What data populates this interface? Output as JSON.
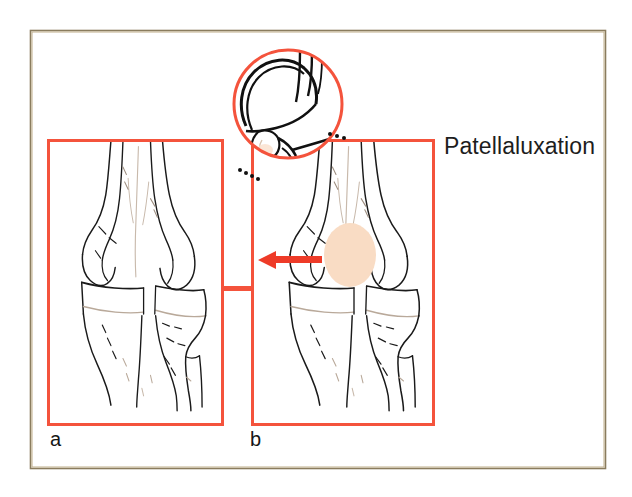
{
  "figure": {
    "kind": "medical-illustration",
    "title": "Patellaluxation",
    "outer_frame": {
      "name": "outer-border-frame",
      "color": "#7c6f52",
      "x": 30,
      "y": 30,
      "width": 575,
      "height": 438
    },
    "accent_color": "#f4533c",
    "arrow_color": "#ee3b28",
    "patella_fill": "#f9dcc4",
    "bone_line_color": "#1a1a1a",
    "bone_shade_color": "#b9a99a"
  },
  "panels": [
    {
      "id": "a",
      "name": "panel-a",
      "label": "a",
      "label_x": 50,
      "label_y": 428,
      "description": "Normal knee, anterior view",
      "box": {
        "x": 48,
        "y": 140,
        "width": 174,
        "height": 284
      },
      "has_arrow": false,
      "has_patella_marker": false
    },
    {
      "id": "b",
      "name": "panel-b",
      "label": "b",
      "label_x": 250,
      "label_y": 428,
      "description": "Luxated patella, anterior view with displacement arrow",
      "box": {
        "x": 252,
        "y": 140,
        "width": 181,
        "height": 284
      },
      "has_arrow": true,
      "has_patella_marker": true
    }
  ],
  "connector": {
    "name": "panel-connector-bar",
    "x": 222,
    "y": 286,
    "width": 30,
    "height": 5
  },
  "inset": {
    "name": "magnifier-circle-inset",
    "description": "Lateral magnified view of patella and femoral trochlea",
    "center_x": 288,
    "center_y": 104,
    "radius": 56
  },
  "annotations": {
    "displacement_arrow": {
      "name": "displacement-arrow",
      "direction": "left",
      "tail_x": 322,
      "head_x": 258,
      "y": 260
    },
    "patella_marker": {
      "name": "patella-shadow-ellipse",
      "center_x": 350,
      "center_y": 255,
      "rx": 26,
      "ry": 32
    },
    "leader_dots_lower_left": {
      "name": "leader-dots-lower-left",
      "points": [
        [
          243,
          172
        ],
        [
          248,
          175
        ],
        [
          253,
          178
        ],
        [
          258,
          181
        ]
      ]
    },
    "leader_dots_upper_right": {
      "name": "leader-dots-upper-right",
      "points": [
        [
          330,
          133
        ],
        [
          336,
          135
        ],
        [
          342,
          137
        ]
      ]
    }
  }
}
